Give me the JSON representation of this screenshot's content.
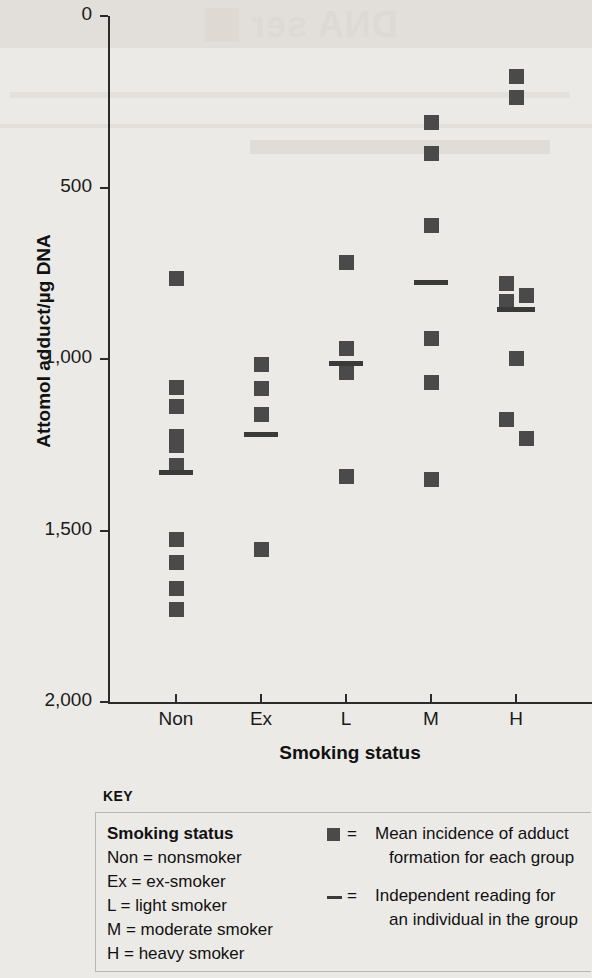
{
  "ghost": {
    "reverse_text": "DNA ser"
  },
  "axes": {
    "y_title": "Attomol adduct/µg DNA",
    "x_title": "Smoking status",
    "y_ticks": [
      "2,000",
      "1,500",
      "1,000",
      "500",
      "0"
    ],
    "x_ticks": [
      "Non",
      "Ex",
      "L",
      "M",
      "H"
    ]
  },
  "key": {
    "title": "KEY",
    "left_heading": "Smoking status",
    "left_items": [
      "Non = nonsmoker",
      "Ex = ex-smoker",
      "L = light smoker",
      "M = moderate smoker",
      "H = heavy smoker"
    ],
    "right_items": [
      {
        "glyph": "square-marker",
        "eq": "=",
        "line1": "Mean incidence of adduct",
        "line2": "formation for each group"
      },
      {
        "glyph": "dash-marker",
        "eq": "=",
        "line1": "Independent reading for",
        "line2": "an individual in the group"
      }
    ]
  },
  "colors": {
    "marker": "#4a4a4a",
    "mean_line": "#3a3a3a",
    "axis": "#2b2b2b",
    "background": "#eceae7"
  },
  "chart_data": {
    "type": "scatter",
    "title": "",
    "xlabel": "Smoking status",
    "ylabel": "Attomol adduct/µg DNA",
    "ylim": [
      0,
      2000
    ],
    "ytick_values": [
      0,
      500,
      1000,
      1500,
      2000
    ],
    "grid": false,
    "legend": "below-plot",
    "categories": [
      "Non",
      "Ex",
      "L",
      "M",
      "H"
    ],
    "category_full_names": [
      "nonsmoker",
      "ex-smoker",
      "light smoker",
      "moderate smoker",
      "heavy smoker"
    ],
    "marker_meaning": "Mean incidence of adduct formation for each group",
    "line_meaning": "Independent reading for an individual in the group",
    "groups": [
      {
        "name": "Non",
        "points": [
          1237,
          918,
          862,
          775,
          748,
          690,
          474,
          409,
          333,
          272
        ],
        "offsets": [
          0,
          0,
          0,
          0,
          0,
          0,
          0,
          0,
          0,
          0
        ],
        "mean_line": 672
      },
      {
        "name": "Ex",
        "points": [
          985,
          915,
          839,
          445
        ],
        "offsets": [
          0,
          0,
          0,
          0
        ],
        "mean_line": 781
      },
      {
        "name": "L",
        "points": [
          1283,
          1032,
          962,
          658
        ],
        "offsets": [
          0,
          0,
          0,
          0
        ],
        "mean_line": 988
      },
      {
        "name": "M",
        "points": [
          1690,
          1602,
          1392,
          1061,
          933,
          649
        ],
        "offsets": [
          0,
          0,
          0,
          0,
          0,
          0
        ],
        "mean_line": 1225
      },
      {
        "name": "H",
        "points": [
          1825,
          1763,
          1222,
          1187,
          1170,
          1003,
          824,
          769
        ],
        "offsets": [
          0,
          0,
          -10,
          10,
          -10,
          0,
          -10,
          10
        ],
        "mean_line": 1146
      }
    ]
  }
}
